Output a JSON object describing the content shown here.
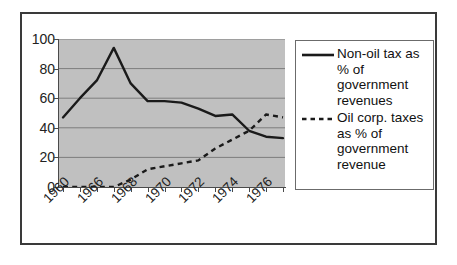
{
  "chart_data": {
    "type": "line",
    "title": "",
    "subtitle": "",
    "xlabel": "",
    "ylabel": "",
    "ylim": [
      0,
      100
    ],
    "ytick_labels": [
      "100",
      "80",
      "60",
      "40",
      "20",
      "0"
    ],
    "ytick_values": [
      100,
      80,
      60,
      40,
      20,
      0
    ],
    "xtick_labels": [
      "1960",
      "1966",
      "1968",
      "1970",
      "1972",
      "1974",
      "1976"
    ],
    "grid": "horizontal",
    "plot_background": "#c0c0c0",
    "legend_position": "right",
    "x": [
      1960,
      1965,
      1966,
      1967,
      1968,
      1969,
      1970,
      1971,
      1972,
      1973,
      1974,
      1975,
      1976,
      1977
    ],
    "series": [
      {
        "name": "Non-oil tax as % of government revenues",
        "style": "solid",
        "color": "#1a1a1a",
        "values": [
          47,
          60,
          72,
          94,
          70,
          58,
          58,
          57,
          53,
          48,
          49,
          38,
          34,
          33
        ]
      },
      {
        "name": "Oil corp. taxes as % of government revenue",
        "style": "dashed",
        "color": "#1a1a1a",
        "values": [
          0,
          0,
          0,
          0,
          5,
          12,
          14,
          16,
          18,
          26,
          32,
          38,
          49,
          47
        ]
      }
    ]
  },
  "legend": {
    "entries": [
      {
        "sample": "solid-line-sample",
        "label": "Non-oil tax as % of government revenues"
      },
      {
        "sample": "dashed-line-sample",
        "label": "Oil corp. taxes as % of government revenue"
      }
    ]
  },
  "axes": {
    "y_labels": [
      "100",
      "80",
      "60",
      "40",
      "20",
      "0"
    ],
    "x_labels": [
      "1960",
      "1966",
      "1968",
      "1970",
      "1972",
      "1974",
      "1976"
    ]
  }
}
